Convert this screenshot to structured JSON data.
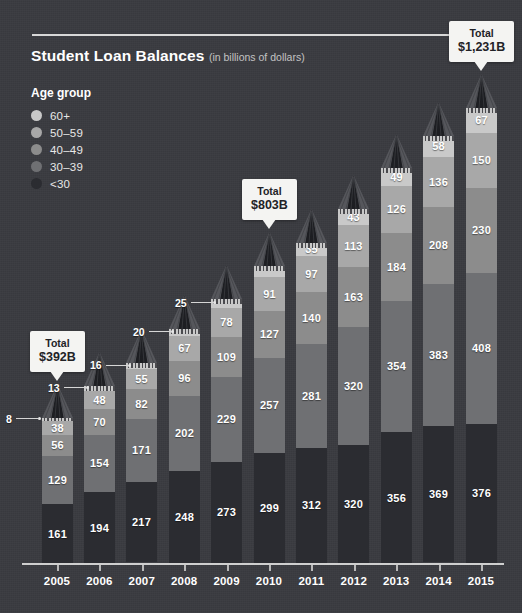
{
  "title": {
    "main": "Student Loan Balances",
    "sub": "(in billions of dollars)"
  },
  "legend": {
    "heading": "Age group",
    "items": [
      {
        "label": "60+",
        "color": "#c9c9c9"
      },
      {
        "label": "50–59",
        "color": "#a8a8a8"
      },
      {
        "label": "40–49",
        "color": "#8c8c8c"
      },
      {
        "label": "30–39",
        "color": "#6f7073"
      },
      {
        "label": "<30",
        "color": "#2b2c31"
      }
    ]
  },
  "callouts": [
    {
      "name": "total-2005",
      "line1": "Total",
      "line2": "$392B"
    },
    {
      "name": "total-2010",
      "line1": "Total",
      "line2": "$803B"
    },
    {
      "name": "total-2015",
      "line1": "Total",
      "line2": "$1,231B"
    }
  ],
  "chart_data": {
    "type": "bar",
    "stacked": true,
    "title": "Student Loan Balances (in billions of dollars)",
    "xlabel": "",
    "ylabel": "Billions of dollars",
    "grid": false,
    "legend_position": "top-left",
    "categories": [
      "2005",
      "2006",
      "2007",
      "2008",
      "2009",
      "2010",
      "2011",
      "2012",
      "2013",
      "2014",
      "2015"
    ],
    "series": [
      {
        "name": "<30",
        "color": "#2b2c31",
        "values": [
          161,
          194,
          217,
          248,
          273,
          299,
          312,
          320,
          356,
          369,
          376
        ]
      },
      {
        "name": "30–39",
        "color": "#6f7073",
        "values": [
          129,
          154,
          171,
          202,
          229,
          257,
          281,
          320,
          354,
          383,
          408
        ]
      },
      {
        "name": "40–49",
        "color": "#8c8c8c",
        "values": [
          56,
          70,
          82,
          96,
          109,
          127,
          140,
          163,
          184,
          208,
          230
        ]
      },
      {
        "name": "50–59",
        "color": "#a8a8a8",
        "values": [
          38,
          48,
          55,
          67,
          78,
          91,
          97,
          113,
          126,
          136,
          150
        ]
      },
      {
        "name": "60+",
        "color": "#c9c9c9",
        "values": [
          8,
          13,
          16,
          20,
          25,
          29,
          35,
          43,
          49,
          58,
          67
        ]
      }
    ],
    "totals": [
      392,
      479,
      541,
      633,
      714,
      803,
      865,
      959,
      1069,
      1154,
      1231
    ],
    "outside_labels": [
      {
        "category": "2005",
        "series": "60+",
        "value": 8
      },
      {
        "category": "2006",
        "series": "60+",
        "value": 13
      },
      {
        "category": "2007",
        "series": "60+",
        "value": 16
      },
      {
        "category": "2008",
        "series": "60+",
        "value": 20
      },
      {
        "category": "2009",
        "series": "60+",
        "value": 25
      }
    ],
    "annotations": [
      {
        "category": "2005",
        "text": "Total $392B"
      },
      {
        "category": "2010",
        "text": "Total $803B"
      },
      {
        "category": "2015",
        "text": "Total $1,231B"
      }
    ]
  }
}
